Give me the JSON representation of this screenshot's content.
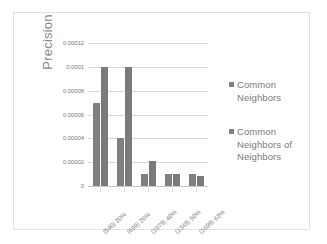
{
  "chart_data": {
    "type": "bar",
    "title": "",
    "xlabel": "",
    "ylabel": "Precision",
    "categories": [
      "(540) 20%",
      "(699) 26%",
      "(1079) 40%",
      "(1349) 50%",
      "(1699) 63%"
    ],
    "series": [
      {
        "name": "Common Neighbors",
        "values": [
          7e-05,
          4e-05,
          1e-05,
          1e-05,
          1e-05
        ]
      },
      {
        "name": "Common Neighbors of Neighbors",
        "values": [
          0.0001,
          0.0001,
          2.1e-05,
          1e-05,
          8e-06
        ]
      }
    ],
    "ylim": [
      0,
      0.00012
    ],
    "yticks": [
      "0",
      "0.00002",
      "0.00004",
      "0.00006",
      "0.00008",
      "0.0001",
      "0.00012"
    ],
    "ytick_values": [
      0,
      2e-05,
      4e-05,
      6e-05,
      8e-05,
      0.0001,
      0.00012
    ],
    "grid": true,
    "legend_position": "right",
    "colors": {
      "series1": "#808080",
      "series2": "#7a7a7a",
      "gridline": "#d9d9d9",
      "text": "#7b7b7b",
      "border": "#e2e2e2",
      "background": "#ffffff"
    }
  },
  "legend": {
    "items": [
      {
        "label": "Common Neighbors",
        "marker": "square-marker"
      },
      {
        "label": "Common Neighbors of Neighbors",
        "marker": "square-marker"
      }
    ]
  }
}
